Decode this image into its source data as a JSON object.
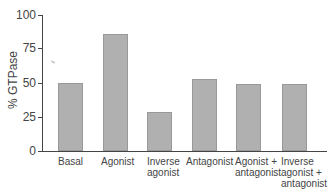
{
  "chart_data": {
    "type": "bar",
    "title": "",
    "xlabel": "",
    "ylabel": "% GTPase",
    "ylim": [
      0,
      100
    ],
    "yticks": [
      0,
      25,
      50,
      75,
      100
    ],
    "grid": false,
    "legend": null,
    "categories": [
      "Basal",
      "Agonist",
      "Inverse agonist",
      "Antagonist",
      "Agonist + antagonist",
      "Inverse agonist + antagonist"
    ],
    "values": [
      50,
      86,
      29,
      53,
      49,
      49
    ],
    "bar_color": "#b0b0b0"
  },
  "axis": {
    "ylabel": "% GTPase",
    "ticks": [
      "0",
      "25",
      "50",
      "75",
      "100"
    ]
  },
  "labels": {
    "c0": [
      "Basal"
    ],
    "c1": [
      "Agonist"
    ],
    "c2": [
      "Inverse",
      "agonist"
    ],
    "c3": [
      "Antagonist"
    ],
    "c4": [
      "Agonist +",
      "antagonist"
    ],
    "c5": [
      "Inverse",
      "agonist +",
      "antagonist"
    ]
  }
}
